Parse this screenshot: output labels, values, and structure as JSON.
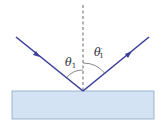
{
  "diagram": {
    "type": "reflection",
    "labels": {
      "incident_angle": "θ",
      "incident_sub": "1",
      "reflected_angle": "θ",
      "reflected_prime": "′",
      "reflected_sub": "1"
    },
    "colors": {
      "ray": "#3a3f9a",
      "normal": "#555555",
      "surface_fill": "#d3e3f4",
      "surface_stroke": "#8aa6c8",
      "arc": "#555555"
    }
  }
}
